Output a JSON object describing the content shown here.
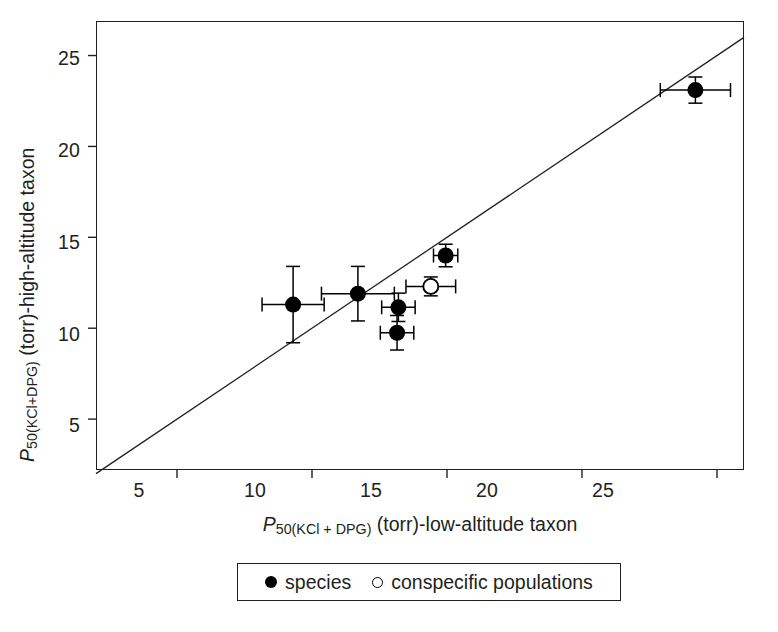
{
  "chart_data": {
    "type": "scatter",
    "title": "",
    "xlabel": "P50(KCl + DPG) (torr)-low-altitude taxon",
    "ylabel": "P50(KCl+DPG) (torr)-high-altitude taxon",
    "xlabel_parts": {
      "p": "P",
      "sub": "50(KCl + DPG)",
      "rest": " (torr)-low-altitude taxon"
    },
    "ylabel_parts": {
      "p": "P",
      "sub": "50(KCl+DPG)",
      "rest": " (torr)-high-altitude taxon"
    },
    "xlim": [
      2.0,
      26.0
    ],
    "ylim": [
      2.2,
      26.9
    ],
    "xticks": [
      5,
      10,
      15,
      20,
      25
    ],
    "xtick_labels": [
      "5",
      "10",
      "15",
      "20",
      "25"
    ],
    "yticks": [
      5,
      10,
      15,
      20,
      25
    ],
    "ytick_labels": [
      "5",
      "10",
      "15",
      "20",
      "25"
    ],
    "grid": false,
    "legend_position": "below-axes",
    "reference_line": {
      "name": "identity-line",
      "description": "1:1 line drawn corner to corner of the plot frame",
      "slope": 1,
      "intercept": 0,
      "x_from": 2.0,
      "x_to": 26.0
    },
    "series": [
      {
        "name": "species",
        "marker": "filled-circle",
        "color": "#000000",
        "points": [
          {
            "x": 9.3,
            "y": 11.3,
            "xerr": 1.15,
            "yerr": 2.1
          },
          {
            "x": 11.7,
            "y": 11.9,
            "xerr": 1.35,
            "yerr": 1.5
          },
          {
            "x": 13.2,
            "y": 11.15,
            "xerr": 0.62,
            "yerr": 0.78
          },
          {
            "x": 13.15,
            "y": 9.75,
            "xerr": 0.62,
            "yerr": 0.95
          },
          {
            "x": 14.95,
            "y": 14.0,
            "xerr": 0.45,
            "yerr": 0.62
          },
          {
            "x": 24.2,
            "y": 23.1,
            "xerr": 1.3,
            "yerr": 0.72
          }
        ]
      },
      {
        "name": "conspecific populations",
        "marker": "open-circle",
        "color": "#000000",
        "points": [
          {
            "x": 14.4,
            "y": 12.3,
            "xerr": 0.92,
            "yerr": 0.52
          }
        ]
      }
    ],
    "legend": [
      {
        "label": "species",
        "marker": "filled-circle"
      },
      {
        "label": "conspecific populations",
        "marker": "open-circle"
      }
    ]
  }
}
